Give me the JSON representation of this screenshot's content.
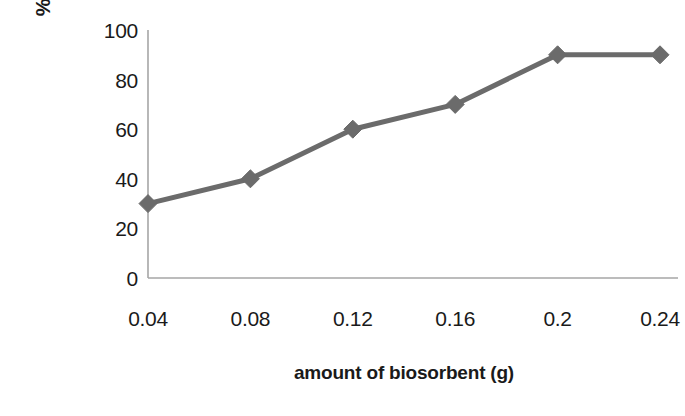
{
  "chart_data": {
    "type": "line",
    "title": "",
    "xlabel": "amount of biosorbent (g)",
    "ylabel": "% removal of lead",
    "x": [
      0.04,
      0.08,
      0.12,
      0.16,
      0.2,
      0.24
    ],
    "xtick_labels": [
      "0.04",
      "0.08",
      "0.12",
      "0.16",
      "0.2",
      "0.24"
    ],
    "values": [
      30,
      40,
      60,
      70,
      90,
      90
    ],
    "ytick_labels": [
      "0",
      "20",
      "40",
      "60",
      "80",
      "100"
    ],
    "yticks": [
      0,
      20,
      40,
      60,
      80,
      100
    ],
    "ylim": [
      0,
      100
    ],
    "xlim": [
      0.04,
      0.24
    ],
    "grid": false,
    "legend": null,
    "legend_position": "none",
    "series": [
      {
        "name": "% removal of lead",
        "values": [
          30,
          40,
          60,
          70,
          90,
          90
        ],
        "color": "#6b6b6b",
        "marker": "diamond",
        "line_width": 5
      }
    ],
    "colors": {
      "line": "#6b6b6b",
      "marker": "#6b6b6b",
      "axis": "#a6a6a6",
      "text": "#1a1a1a",
      "background": "#ffffff"
    }
  }
}
